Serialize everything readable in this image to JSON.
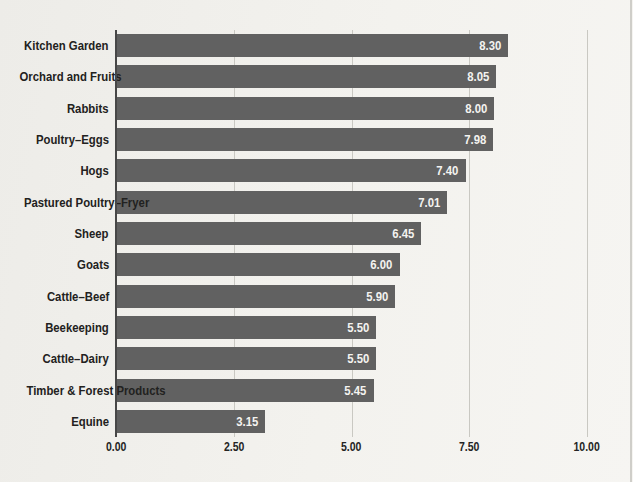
{
  "chart_data": {
    "type": "bar",
    "orientation": "horizontal",
    "title": "",
    "xlabel": "",
    "ylabel": "",
    "categories": [
      "Kitchen Garden",
      "Orchard and Fruits",
      "Rabbits",
      "Poultry–Eggs",
      "Hogs",
      "Pastured Poultry–Fryer",
      "Sheep",
      "Goats",
      "Cattle–Beef",
      "Beekeeping",
      "Cattle–Dairy",
      "Timber & Forest Products",
      "Equine"
    ],
    "values": [
      8.3,
      8.05,
      8.0,
      7.98,
      7.4,
      7.01,
      6.45,
      6.0,
      5.9,
      5.5,
      5.5,
      5.45,
      3.15
    ],
    "value_labels": [
      "8.30",
      "8.05",
      "8.00",
      "7.98",
      "7.40",
      "7.01",
      "6.45",
      "6.00",
      "5.90",
      "5.50",
      "5.50",
      "5.45",
      "3.15"
    ],
    "x_ticks": [
      "0.00",
      "2.50",
      "5.00",
      "7.50",
      "10.00"
    ],
    "x_tick_values": [
      0,
      2.5,
      5,
      7.5,
      10
    ],
    "xlim": [
      0,
      10
    ],
    "grid": "vertical-only",
    "legend": "none",
    "value_label_position": "inside-end",
    "colors": {
      "bar": "#616161",
      "value_text": "#f4f3f0",
      "category_text": "#222120",
      "gridline": "#c9c8c2",
      "axis_line": "#474747",
      "background": "#f1f0ec"
    }
  }
}
